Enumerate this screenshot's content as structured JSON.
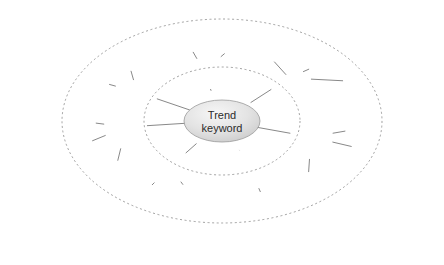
{
  "diagram": {
    "type": "radial-mind-map",
    "background_color": "#ffffff",
    "center": {
      "label_line1": "Trend",
      "label_line2": "keyword",
      "cx": 222,
      "cy": 121,
      "rx": 38,
      "ry": 21,
      "fill_from": "#f2f2f2",
      "fill_to": "#cfcfcf",
      "stroke": "#9a9a9a",
      "text_color": "#2b2b2b"
    },
    "style": {
      "edge_color": "#555555",
      "ring_color": "#7a7a7a",
      "leaf_stroke": "#d6d6d6",
      "leaf_fill": "#ffffff",
      "halo_color": "#ececec",
      "label_color": "#2b2b2b"
    },
    "rings": [
      {
        "name": "inner-dashed-ring",
        "cx": 222,
        "cy": 121,
        "rx": 78,
        "ry": 54,
        "dash": "2 2.6"
      },
      {
        "name": "outer-dashed-ring",
        "cx": 222,
        "cy": 121,
        "rx": 160,
        "ry": 102,
        "dash": "2 2.6"
      }
    ],
    "primary_label": "Primary Impact",
    "primary_line1": "Primary",
    "primary_line2": "Impact",
    "secondary_label": "secondary",
    "primary_nodes": [
      {
        "id": "p1",
        "label_line1": "Primary",
        "label_line2": "Impact",
        "x": 204,
        "y": 71
      },
      {
        "id": "p2",
        "label_line1": "Primary",
        "label_line2": "Impact",
        "x": 289,
        "y": 78
      },
      {
        "id": "p3",
        "label_line1": "Primary",
        "label_line2": "Impact",
        "x": 311,
        "y": 137
      },
      {
        "id": "p4",
        "label_line1": "Primary",
        "label_line2": "Impact",
        "x": 250,
        "y": 168
      },
      {
        "id": "p5",
        "label_line1": "Primary",
        "label_line2": "Impact",
        "x": 170,
        "y": 167
      },
      {
        "id": "p6",
        "label_line1": "Primary",
        "label_line2": "Impact",
        "x": 126,
        "y": 127
      },
      {
        "id": "p7",
        "label_line1": "Primary",
        "label_line2": "Impact",
        "x": 137,
        "y": 92
      }
    ],
    "secondary_nodes": [
      {
        "id": "s1",
        "label": "secondary",
        "x": 185,
        "y": 38
      },
      {
        "id": "s2",
        "label": "secondary",
        "x": 243,
        "y": 38
      },
      {
        "id": "s3",
        "label": "secondary",
        "x": 270,
        "y": 57
      },
      {
        "id": "s4",
        "label": "secondary",
        "x": 325,
        "y": 62
      },
      {
        "id": "s5",
        "label": "secondary",
        "x": 367,
        "y": 82
      },
      {
        "id": "s6",
        "label": "secondary",
        "x": 369,
        "y": 127
      },
      {
        "id": "s7",
        "label": "secondary",
        "x": 375,
        "y": 152
      },
      {
        "id": "s8",
        "label": "secondary",
        "x": 307,
        "y": 196
      },
      {
        "id": "s9",
        "label": "secondary",
        "x": 270,
        "y": 214
      },
      {
        "id": "s10",
        "label": "secondary",
        "x": 195,
        "y": 201
      },
      {
        "id": "s11",
        "label": "secondary",
        "x": 135,
        "y": 202
      },
      {
        "id": "s12",
        "label": "secondary",
        "x": 112,
        "y": 184
      },
      {
        "id": "s13",
        "label": "secondary",
        "x": 70,
        "y": 150
      },
      {
        "id": "s14",
        "label": "secondary",
        "x": 72,
        "y": 120
      },
      {
        "id": "s15",
        "label": "secondary",
        "x": 86,
        "y": 78
      },
      {
        "id": "s16",
        "label": "secondary",
        "x": 127,
        "y": 57
      }
    ],
    "leaf_nodes": [
      {
        "id": "l1",
        "cx": 158,
        "cy": 16
      },
      {
        "id": "l2",
        "cx": 192,
        "cy": 14
      },
      {
        "id": "l3",
        "cx": 240,
        "cy": 15
      },
      {
        "id": "l4",
        "cx": 283,
        "cy": 24
      },
      {
        "id": "l5",
        "cx": 118,
        "cy": 35
      },
      {
        "id": "l6",
        "cx": 80,
        "cy": 43
      },
      {
        "id": "l7",
        "cx": 374,
        "cy": 52
      },
      {
        "id": "l8",
        "cx": 406,
        "cy": 65
      },
      {
        "id": "l9",
        "cx": 31,
        "cy": 72
      },
      {
        "id": "l10",
        "cx": 420,
        "cy": 88
      },
      {
        "id": "l11",
        "cx": 26,
        "cy": 93
      },
      {
        "id": "l12",
        "cx": 13,
        "cy": 118
      },
      {
        "id": "l13",
        "cx": 424,
        "cy": 139
      },
      {
        "id": "l14",
        "cx": 20,
        "cy": 143
      },
      {
        "id": "l15",
        "cx": 426,
        "cy": 160
      },
      {
        "id": "l16",
        "cx": 22,
        "cy": 167
      },
      {
        "id": "l17",
        "cx": 412,
        "cy": 177
      },
      {
        "id": "l18",
        "cx": 57,
        "cy": 192
      },
      {
        "id": "l19",
        "cx": 125,
        "cy": 211
      },
      {
        "id": "l20",
        "cx": 82,
        "cy": 213
      },
      {
        "id": "l21",
        "cx": 355,
        "cy": 203
      },
      {
        "id": "l22",
        "cx": 330,
        "cy": 175
      },
      {
        "id": "l23",
        "cx": 341,
        "cy": 197
      },
      {
        "id": "l24",
        "cx": 380,
        "cy": 218
      },
      {
        "id": "l25",
        "cx": 148,
        "cy": 243
      },
      {
        "id": "l26",
        "cx": 240,
        "cy": 246
      },
      {
        "id": "l27",
        "cx": 277,
        "cy": 247
      },
      {
        "id": "l28",
        "cx": 313,
        "cy": 245
      },
      {
        "id": "l29",
        "cx": 100,
        "cy": 63
      },
      {
        "id": "l30",
        "cx": 62,
        "cy": 108
      }
    ]
  }
}
